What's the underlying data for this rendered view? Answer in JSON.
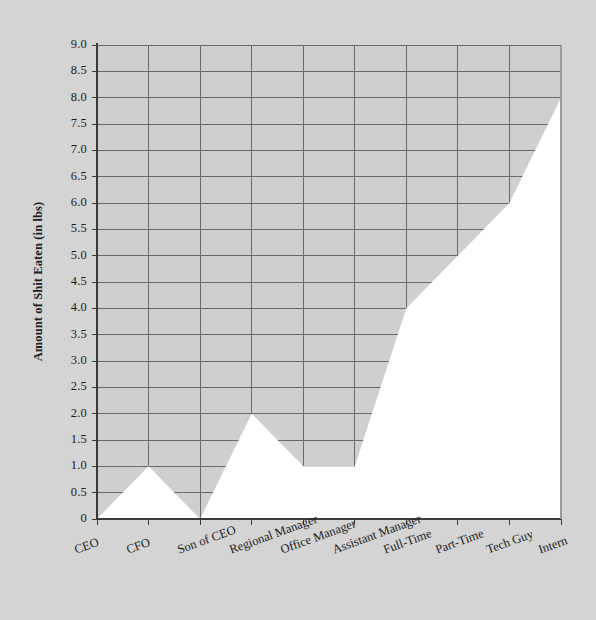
{
  "chart_data": {
    "type": "area",
    "title": "",
    "subtitle": "",
    "xlabel": "",
    "ylabel": "Amount of Shit Eaten (in lbs)",
    "categories": [
      "CEO",
      "CFO",
      "Son of CEO",
      "Regional Manager",
      "Office Manager",
      "Assistant Manager",
      "Full-Time",
      "Part-Time",
      "Tech Guy",
      "Intern"
    ],
    "values": [
      0,
      1.0,
      0,
      2.0,
      1.0,
      1.0,
      4.0,
      5.0,
      6.0,
      8.0
    ],
    "ylim": [
      0,
      9
    ],
    "yticks": [
      "0",
      "0.5",
      "1.0",
      "1.5",
      "2.0",
      "2.5",
      "3.0",
      "3.5",
      "4.0",
      "4.5",
      "5.0",
      "5.5",
      "6.0",
      "6.5",
      "7.0",
      "7.5",
      "8.0",
      "8.5",
      "9.0"
    ],
    "ytick_values": [
      0,
      0.5,
      1.0,
      1.5,
      2.0,
      2.5,
      3.0,
      3.5,
      4.0,
      4.5,
      5.0,
      5.5,
      6.0,
      6.5,
      7.0,
      7.5,
      8.0,
      8.5,
      9.0
    ],
    "grid": true,
    "legend": "none",
    "fill_color": "#ffffff",
    "plot_bg_color": "#cfcfcf",
    "page_bg_color": "#d4d4d4",
    "grid_color": "#6b6b6b",
    "axis_color": "#4a4a4a",
    "text_color": "#1b1b1b"
  }
}
